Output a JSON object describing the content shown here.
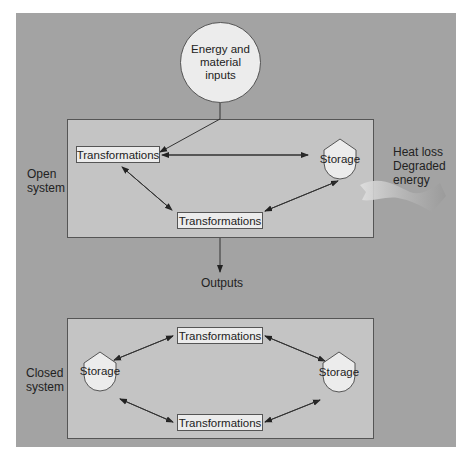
{
  "diagram": {
    "inputs": {
      "line1": "Energy and",
      "line2": "material",
      "line3": "inputs"
    },
    "open_system": {
      "label_line1": "Open",
      "label_line2": "system",
      "transformations_top": "Transformations",
      "transformations_bottom": "Transformations",
      "storage": "Storage"
    },
    "heat_loss": {
      "line1": "Heat loss",
      "line2": "Degraded",
      "line3": "energy"
    },
    "outputs": "Outputs",
    "closed_system": {
      "label_line1": "Closed",
      "label_line2": "system",
      "transformations_top": "Transformations",
      "transformations_bottom": "Transformations",
      "storage_left": "Storage",
      "storage_right": "Storage"
    }
  },
  "colors": {
    "panel": "#a3a3a3",
    "system_box": "#c4c4c4",
    "node_fill": "#ececec",
    "stroke": "#555555"
  }
}
